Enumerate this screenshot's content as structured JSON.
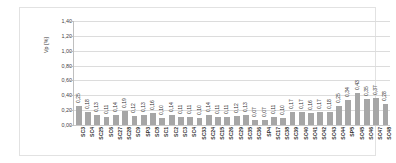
{
  "chart_data": {
    "type": "bar",
    "title": "",
    "xlabel": "",
    "ylabel": "Vp [%]",
    "ylim": [
      0,
      1.4
    ],
    "ytick_step": 0.2,
    "ytick_labels": [
      "1,40",
      "1,20",
      "1,00",
      "0,80",
      "0,60",
      "0,40",
      "0,20",
      "0,00"
    ],
    "ytick_values": [
      1.4,
      1.2,
      1.0,
      0.8,
      0.6,
      0.4,
      0.2,
      0.0
    ],
    "grid": true,
    "legend": false,
    "bar_color": "#a6a6a6",
    "gridline_color": "#dcdcdc",
    "categories": [
      "SC3",
      "SC4",
      "SC25",
      "SC6",
      "SC27",
      "SC28",
      "SC9",
      "SP3",
      "SC8",
      "SC1",
      "SC2",
      "SC3",
      "SC4",
      "SC33",
      "SC24",
      "SC15",
      "SC26",
      "SC29",
      "SC35",
      "SC36",
      "SP4",
      "SC17",
      "SC38",
      "SC39",
      "SC40",
      "SC41",
      "SC42",
      "SC43",
      "SC44",
      "SP5",
      "SC45",
      "SC46",
      "SC47",
      "SC48"
    ],
    "values": [
      0.25,
      0.18,
      0.13,
      0.11,
      0.14,
      0.19,
      0.12,
      0.13,
      0.16,
      0.1,
      0.14,
      0.11,
      0.11,
      0.1,
      0.14,
      0.11,
      0.11,
      0.12,
      0.13,
      0.07,
      0.07,
      0.11,
      0.1,
      0.17,
      0.17,
      0.16,
      0.17,
      0.18,
      0.25,
      0.34,
      0.43,
      0.35,
      0.37,
      0.28
    ],
    "value_labels": [
      "0,25",
      "0,18",
      "0,13",
      "0,11",
      "0,14",
      "0,19",
      "0,12",
      "0,13",
      "0,16",
      "0,10",
      "0,14",
      "0,11",
      "0,11",
      "0,10",
      "0,14",
      "0,11",
      "0,11",
      "0,12",
      "0,13",
      "0,07",
      "0,07",
      "0,11",
      "0,10",
      "0,17",
      "0,17",
      "0,16",
      "0,17",
      "0,18",
      "0,25",
      "0,34",
      "0,43",
      "0,35",
      "0,37",
      "0,28"
    ]
  }
}
